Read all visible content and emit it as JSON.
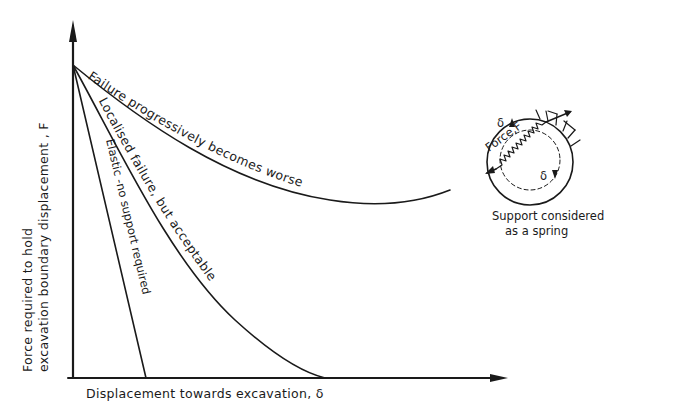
{
  "diagram": {
    "y_axis_label_line1": "Force required to hold",
    "y_axis_label_line2": "excavation boundary displacement , F",
    "x_axis_label": "Displacement towards excavation, δ",
    "curves": [
      {
        "id": "elastic",
        "label": "Elastic -no support required"
      },
      {
        "id": "localised",
        "label": "Localised failure, but acceptable"
      },
      {
        "id": "progressive",
        "label": "Failure progressively becomes worse"
      }
    ],
    "inset": {
      "force_label": "Force,F",
      "delta_top": "δ",
      "delta_bottom": "δ",
      "caption_line1": "Support considered",
      "caption_line2": "as a spring"
    }
  }
}
